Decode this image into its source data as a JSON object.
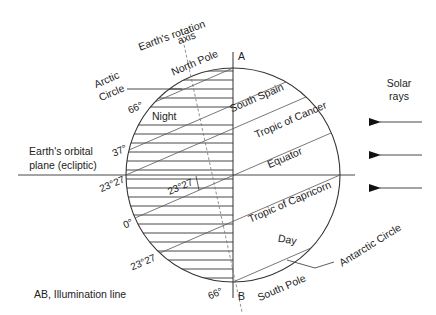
{
  "figure": {
    "title_axis": [
      "Earth's rotation",
      "axis"
    ],
    "north_pole": "North Pole",
    "south_pole": "South Pole",
    "point_a": "A",
    "point_b": "B",
    "arctic_label": [
      "Arctic",
      "Circle"
    ],
    "antarctic_label": "Antarctic Circle",
    "night": "Night",
    "day": "Day",
    "ecliptic_label": [
      "Earth's orbital",
      "plane (ecliptic)"
    ],
    "solar_label": [
      "Solar",
      "rays"
    ],
    "illumination_label": "AB, Illumination line",
    "parallels": [
      {
        "name": "arctic",
        "label": "",
        "lat": 66.55
      },
      {
        "name": "south-spain",
        "label": "South Spain",
        "lat": 37
      },
      {
        "name": "tropic-of-cancer",
        "label": "Tropic of Cancer",
        "lat": 23.45
      },
      {
        "name": "equator",
        "label": "Equator",
        "lat": 0
      },
      {
        "name": "tropic-of-capricorn",
        "label": "Tropic of Capricorn",
        "lat": -23.45
      },
      {
        "name": "antarctic",
        "label": "",
        "lat": -66.55
      }
    ],
    "angle_labels": {
      "a66_top": "66°",
      "a37": "37°",
      "a2327_ecl": "23°27",
      "a2327_inner": "23°27",
      "a0": "0°",
      "a2327_low": "23°27",
      "a66_bottom": "66°"
    },
    "colors": {
      "line": "#333333",
      "thin": "#666666",
      "text": "#222222"
    }
  }
}
